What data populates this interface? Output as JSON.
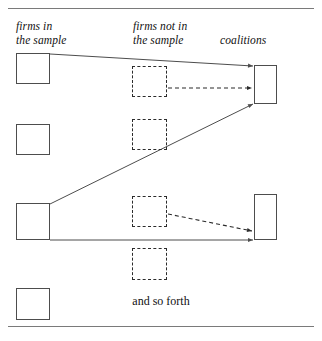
{
  "figure": {
    "columns": [
      {
        "id": "firms-in-sample",
        "label": "firms in\nthe sample"
      },
      {
        "id": "firms-not-in-sample",
        "label": "firms not in\nthe sample"
      },
      {
        "id": "coalitions",
        "label": "coalitions"
      }
    ],
    "caption": "and so forth",
    "colors": {
      "rule": "#7a7a7a",
      "solid_box_border": "#4d4d4d",
      "dashed_box_border": "#2b2b2b",
      "solid_link": "#4d4d4d",
      "dashed_link": "#2b2b2b",
      "text": "#111111",
      "background": "#ffffff"
    },
    "nodes": {
      "sampled_firms": [
        {
          "id": "firm-1",
          "x": 16,
          "y": 53,
          "w": 34,
          "h": 31,
          "style": "solid"
        },
        {
          "id": "firm-2",
          "x": 16,
          "y": 124,
          "w": 34,
          "h": 31,
          "style": "solid"
        },
        {
          "id": "firm-3",
          "x": 16,
          "y": 203,
          "w": 34,
          "h": 37,
          "style": "solid"
        },
        {
          "id": "firm-4",
          "x": 16,
          "y": 288,
          "w": 34,
          "h": 32,
          "style": "solid"
        }
      ],
      "unsampled_firms": [
        {
          "id": "nonfirm-1",
          "x": 132,
          "y": 66,
          "w": 35,
          "h": 31,
          "style": "dashed"
        },
        {
          "id": "nonfirm-2",
          "x": 132,
          "y": 119,
          "w": 35,
          "h": 31,
          "style": "dashed"
        },
        {
          "id": "nonfirm-3",
          "x": 132,
          "y": 196,
          "w": 35,
          "h": 31,
          "style": "dashed"
        },
        {
          "id": "nonfirm-4",
          "x": 132,
          "y": 248,
          "w": 35,
          "h": 32,
          "style": "dashed"
        }
      ],
      "coalitions": [
        {
          "id": "coalition-1",
          "x": 254,
          "y": 65,
          "w": 23,
          "h": 39,
          "style": "solid"
        },
        {
          "id": "coalition-2",
          "x": 254,
          "y": 194,
          "w": 23,
          "h": 46,
          "style": "solid"
        }
      ]
    },
    "links": [
      {
        "id": "link-firm1-coalition1",
        "style": "solid",
        "from": "firm-1",
        "to": "coalition-1",
        "x1": 50,
        "y1": 54,
        "x2": 253,
        "y2": 66,
        "arrow": true
      },
      {
        "id": "link-nonfirm1-coalition1",
        "style": "dashed",
        "from": "nonfirm-1",
        "to": "coalition-1",
        "x1": 168,
        "y1": 88,
        "x2": 252,
        "y2": 88,
        "arrow": true
      },
      {
        "id": "link-firm3-coalition1",
        "style": "solid",
        "from": "firm-3",
        "to": "coalition-1",
        "x1": 50,
        "y1": 204,
        "x2": 253,
        "y2": 104,
        "arrow": true
      },
      {
        "id": "link-firm3-coalition2",
        "style": "solid",
        "from": "firm-3",
        "to": "coalition-2",
        "x1": 50,
        "y1": 240,
        "x2": 253,
        "y2": 240,
        "arrow": true
      },
      {
        "id": "link-nonfirm3-coalition2",
        "style": "dashed",
        "from": "nonfirm-3",
        "to": "coalition-2",
        "x1": 168,
        "y1": 214,
        "x2": 252,
        "y2": 231,
        "arrow": true
      }
    ]
  }
}
